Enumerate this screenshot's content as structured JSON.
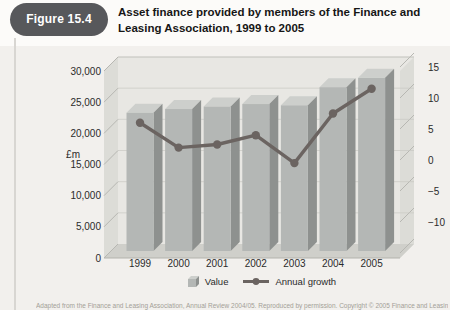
{
  "figure": {
    "label": "Figure 15.4",
    "title": "Asset finance provided by members of the Finance and Leasing Association, 1999 to 2005"
  },
  "chart_data": {
    "type": "bar+line",
    "categories": [
      "1999",
      "2000",
      "2001",
      "2002",
      "2003",
      "2004",
      "2005"
    ],
    "series": [
      {
        "name": "Value",
        "type": "bar",
        "axis": "left",
        "values": [
          23300,
          23900,
          24300,
          24700,
          24500,
          27400,
          28900
        ]
      },
      {
        "name": "Annual growth",
        "type": "line",
        "axis": "right",
        "values": [
          6,
          2,
          2.5,
          4,
          -0.5,
          7.5,
          11.5
        ]
      }
    ],
    "left_axis": {
      "label": "£m",
      "min": 0,
      "max": 30000,
      "tick_values": [
        0,
        5000,
        10000,
        15000,
        20000,
        25000,
        30000
      ],
      "tick_labels": [
        "0",
        "5,000",
        "10,000",
        "15,000",
        "20,000",
        "25,000",
        "30,000"
      ]
    },
    "right_axis": {
      "min": -15,
      "max": 15,
      "tick_values": [
        15,
        10,
        5,
        0,
        -5,
        -10
      ],
      "tick_labels": [
        "15",
        "10",
        "5",
        "0",
        "−5",
        "−10"
      ]
    },
    "legend_position": "bottom",
    "grid": "horizontal-faint",
    "style": {
      "bar_front": "#b4b7b5",
      "bar_side": "#8e918f",
      "bar_top": "#cdcfcc",
      "line_color": "#6b6461",
      "wall": "#e8e7e3",
      "wall_side": "#dcdcd7",
      "floor": "#cfcfca",
      "gridline": "#c6c6c1",
      "hatch": "#b7b7b2",
      "badge_bg": "#57585b",
      "badge_text": "#ffffff"
    }
  },
  "legend": {
    "value_label": "Value",
    "growth_label": "Annual growth"
  },
  "caption": "Adapted from the Finance and Leasing Association, Annual Review 2004/05. Reproduced by permission. Copyright © 2005 Finance and Leasing Association."
}
